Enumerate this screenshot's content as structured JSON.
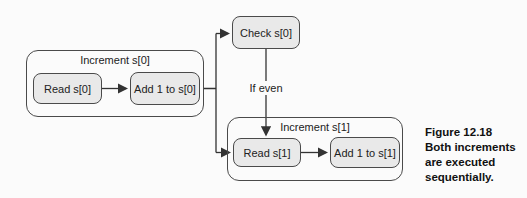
{
  "diagram": {
    "groups": [
      {
        "id": "increment-s0",
        "label": "Increment s[0]"
      },
      {
        "id": "increment-s1",
        "label": "Increment s[1]"
      }
    ],
    "nodes": [
      {
        "id": "read-s0",
        "label": "Read s[0]"
      },
      {
        "id": "add-1-to-s0",
        "label": "Add 1 to s[0]"
      },
      {
        "id": "check-s0",
        "label": "Check s[0]"
      },
      {
        "id": "read-s1",
        "label": "Read s[1]"
      },
      {
        "id": "add-1-to-s1",
        "label": "Add 1 to s[1]"
      }
    ],
    "edge_label": "If even",
    "colors": {
      "node_fill": "#e9e9e9",
      "border": "#4a4a4a",
      "line": "#333333",
      "background": "#fbfbfb",
      "text": "#222222"
    }
  },
  "caption": {
    "lines": [
      "Figure 12.18",
      "Both increments",
      "are executed",
      "sequentially."
    ]
  }
}
